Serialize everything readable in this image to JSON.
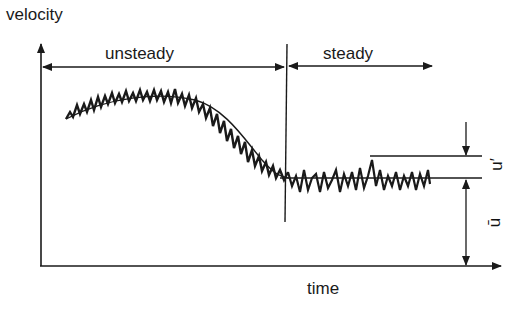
{
  "diagram": {
    "axes": {
      "y_label": "velocity",
      "x_label": "time"
    },
    "regions": [
      {
        "label": "unsteady"
      },
      {
        "label": "steady"
      }
    ],
    "annotations": {
      "fluctuation_label": "u′",
      "mean_label": "ū"
    },
    "colors": {
      "ink": "#1a1a1a",
      "background": "#ffffff"
    }
  }
}
